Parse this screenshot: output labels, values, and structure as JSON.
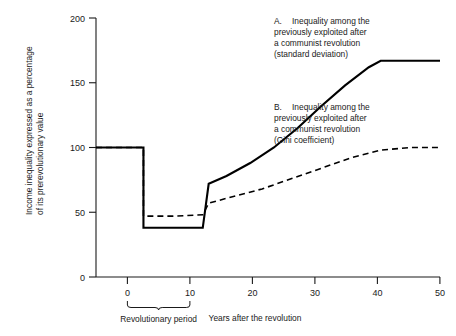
{
  "chart_data": {
    "type": "line",
    "title": "",
    "xlabel": "Years after the revolution",
    "ylabel_line1": "Income inequality expressed as a percentage",
    "ylabel_line2": "of its prerevolutionary value",
    "xlim": [
      -8,
      50
    ],
    "ylim": [
      0,
      200
    ],
    "grid": false,
    "legend_position": "inline-annotations",
    "x_ticks": [
      "0",
      "10",
      "20",
      "30",
      "40",
      "50"
    ],
    "x_tick_values": [
      0,
      10,
      20,
      30,
      40,
      50
    ],
    "y_ticks": [
      "0",
      "50",
      "100",
      "150",
      "200"
    ],
    "y_tick_values": [
      0,
      50,
      100,
      150,
      200
    ],
    "region_label": "Revolutionary period",
    "region_span": [
      0,
      10
    ],
    "series": [
      {
        "name": "A",
        "label_id": "A.",
        "label_line1": "Inequality among the",
        "label_line2": "previously exploited after",
        "label_line3": "a communist revolution",
        "label_line4": "(standard deviation)",
        "style": "solid",
        "color": "#000000",
        "x": [
          -8,
          0,
          0,
          10,
          11,
          14,
          18,
          22,
          26,
          30,
          34,
          38,
          40,
          44,
          50
        ],
        "values": [
          100,
          100,
          38,
          38,
          72,
          78,
          88,
          100,
          115,
          132,
          148,
          162,
          167,
          167,
          167
        ]
      },
      {
        "name": "B",
        "label_id": "B.",
        "label_line1": "Inequality among the",
        "label_line2": "previously exploited after",
        "label_line3": "a communist revolution",
        "label_line4": "(Gini coefficient)",
        "style": "dashed",
        "color": "#000000",
        "x": [
          -8,
          0,
          0,
          5,
          10,
          11,
          15,
          20,
          25,
          30,
          35,
          40,
          45,
          50
        ],
        "values": [
          100,
          100,
          47,
          47,
          48,
          57,
          62,
          68,
          76,
          84,
          92,
          98,
          100,
          100
        ]
      }
    ]
  }
}
